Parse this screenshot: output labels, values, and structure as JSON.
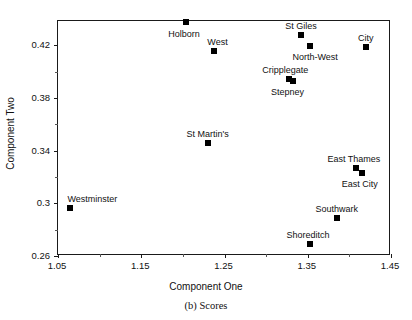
{
  "chart_data": {
    "type": "scatter",
    "title": "",
    "caption": "(b) Scores",
    "xlabel": "Component One",
    "ylabel": "Component Two",
    "xlim": [
      1.05,
      1.45
    ],
    "ylim": [
      0.26,
      0.4385
    ],
    "xticks": [
      1.05,
      1.15,
      1.25,
      1.35,
      1.45
    ],
    "xticklabels": [
      "1.05",
      "1.15",
      "1.25",
      "1.35",
      "1.45"
    ],
    "xminorticks": [
      1.1,
      1.2,
      1.3,
      1.4
    ],
    "yticks": [
      0.26,
      0.3,
      0.34,
      0.38,
      0.42
    ],
    "yticklabels": [
      "0.26",
      "0.3",
      "0.34",
      "0.38",
      "0.42"
    ],
    "yminorticks": [
      0.28,
      0.32,
      0.36,
      0.4
    ],
    "grid": false,
    "legend": false,
    "marker": "square",
    "marker_color": "#000000",
    "points": [
      {
        "name": "Holborn",
        "x": 1.205,
        "y": 0.437,
        "label_dx": -2,
        "label_dy": 7,
        "label_align": "center"
      },
      {
        "name": "West",
        "x": 1.238,
        "y": 0.415,
        "label_dx": 4,
        "label_dy": -14,
        "label_align": "center"
      },
      {
        "name": "St Giles",
        "x": 1.343,
        "y": 0.427,
        "label_dx": 0,
        "label_dy": -14,
        "label_align": "center"
      },
      {
        "name": "North-West",
        "x": 1.354,
        "y": 0.419,
        "label_dx": 5,
        "label_dy": 6,
        "label_align": "center"
      },
      {
        "name": "City",
        "x": 1.421,
        "y": 0.418,
        "label_dx": 0,
        "label_dy": -14,
        "label_align": "center"
      },
      {
        "name": "Cripplegate",
        "x": 1.329,
        "y": 0.3935,
        "label_dx": -4,
        "label_dy": -14,
        "label_align": "center"
      },
      {
        "name": "Stepney",
        "x": 1.334,
        "y": 0.3925,
        "label_dx": -6,
        "label_dy": 6,
        "label_align": "center"
      },
      {
        "name": "St Martin's",
        "x": 1.231,
        "y": 0.345,
        "label_dx": 0,
        "label_dy": -14,
        "label_align": "center"
      },
      {
        "name": "East Thames",
        "x": 1.409,
        "y": 0.3262,
        "label_dx": -2,
        "label_dy": -14,
        "label_align": "center"
      },
      {
        "name": "East City",
        "x": 1.416,
        "y": 0.322,
        "label_dx": -2,
        "label_dy": 6,
        "label_align": "center"
      },
      {
        "name": "Westminster",
        "x": 1.066,
        "y": 0.296,
        "label_dx": 22,
        "label_dy": -14,
        "label_align": "center"
      },
      {
        "name": "Southwark",
        "x": 1.386,
        "y": 0.288,
        "label_dx": 0,
        "label_dy": -14,
        "label_align": "center"
      },
      {
        "name": "Shoreditch",
        "x": 1.354,
        "y": 0.268,
        "label_dx": -2,
        "label_dy": -14,
        "label_align": "center"
      }
    ]
  }
}
